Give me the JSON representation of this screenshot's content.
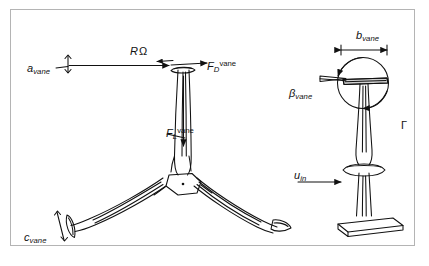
{
  "figure": {
    "kind": "engineering-line-drawing",
    "border_color": "#b4b4b4",
    "ink_color": "#111111",
    "background_color": "#ffffff"
  },
  "left_view": {
    "name": "three-bladed rotor front view",
    "labels": {
      "alpha_vane": {
        "symbol": "a",
        "subscript": "vane",
        "superscript": ""
      },
      "tip_speed": {
        "symbol": "R",
        "subscript": "",
        "superscript": "",
        "second": "Ω"
      },
      "drag_force": {
        "symbol": "F",
        "subscript": "D",
        "superscript": "vane"
      },
      "lift_force": {
        "symbol": "F",
        "subscript": "L",
        "superscript": "vane"
      },
      "chord": {
        "symbol": "c",
        "subscript": "vane",
        "superscript": ""
      }
    },
    "blade_count": 3
  },
  "right_view": {
    "name": "side view with swept circle",
    "labels": {
      "span": {
        "symbol": "b",
        "subscript": "vane",
        "superscript": ""
      },
      "pitch_angle": {
        "symbol": "β",
        "subscript": "vane",
        "superscript": ""
      },
      "circulation": {
        "symbol": "Γ",
        "subscript": "",
        "superscript": ""
      },
      "inflow_velocity": {
        "symbol": "u",
        "subscript": "in",
        "superscript": ""
      }
    }
  }
}
